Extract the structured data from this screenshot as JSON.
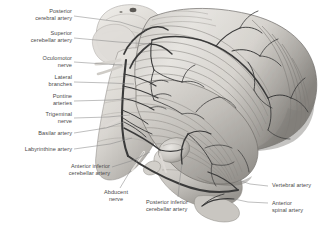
{
  "figure": {
    "type": "anatomical-illustration",
    "style": "grayscale halftone medical illustration",
    "background_color": "#ffffff",
    "label_color": "#4a4a4a",
    "leader_line_color": "#8a8a8a",
    "artery_color": "#3a3a3a",
    "tissue_light": "#e8e6e2",
    "tissue_mid": "#b9b6b1",
    "tissue_dark": "#7d7a76"
  },
  "labels": [
    {
      "id": "posterior-cerebral-artery",
      "text": "Posterior\ncerebral artery",
      "align": "right",
      "x": 8,
      "y": 8,
      "w": 64,
      "leader": [
        [
          74,
          16
        ],
        [
          120,
          22
        ],
        [
          146,
          30
        ]
      ]
    },
    {
      "id": "superior-cerebellar-artery",
      "text": "Superior\ncerebellar artery",
      "align": "right",
      "x": 4,
      "y": 30,
      "w": 68,
      "leader": [
        [
          74,
          38
        ],
        [
          118,
          42
        ],
        [
          150,
          44
        ]
      ]
    },
    {
      "id": "oculomotor-nerve",
      "text": "Oculomotor\nnerve",
      "align": "right",
      "x": 18,
      "y": 55,
      "w": 54,
      "leader": [
        [
          74,
          62
        ],
        [
          104,
          64
        ],
        [
          122,
          65
        ]
      ]
    },
    {
      "id": "lateral-branches",
      "text": "Lateral\nbranches",
      "align": "right",
      "x": 22,
      "y": 74,
      "w": 50,
      "leader": [
        [
          74,
          82
        ],
        [
          110,
          83
        ],
        [
          134,
          84
        ]
      ]
    },
    {
      "id": "pontine-arteries",
      "text": "Pontine\narteries",
      "align": "right",
      "x": 24,
      "y": 93,
      "w": 48,
      "leader": [
        [
          74,
          101
        ],
        [
          112,
          100
        ],
        [
          136,
          98
        ]
      ]
    },
    {
      "id": "trigeminal-nerve",
      "text": "Trigeminal\nnerve",
      "align": "right",
      "x": 20,
      "y": 111,
      "w": 52,
      "leader": [
        [
          74,
          118
        ],
        [
          108,
          117
        ],
        [
          130,
          115
        ]
      ]
    },
    {
      "id": "basilar-artery",
      "text": "Basilar artery",
      "align": "right",
      "x": 18,
      "y": 130,
      "w": 54,
      "leader": [
        [
          74,
          133
        ],
        [
          106,
          128
        ],
        [
          124,
          122
        ]
      ]
    },
    {
      "id": "labyrinthine-artery",
      "text": "Labyrinthine artery",
      "align": "right",
      "x": 8,
      "y": 146,
      "w": 64,
      "leader": [
        [
          74,
          149
        ],
        [
          110,
          144
        ],
        [
          132,
          138
        ]
      ]
    },
    {
      "id": "anterior-inferior-cerebellar-artery",
      "text": "Anterior inferior\ncerebellar artery",
      "align": "right",
      "x": 44,
      "y": 163,
      "w": 66,
      "leader": [
        [
          112,
          167
        ],
        [
          134,
          160
        ],
        [
          150,
          152
        ]
      ]
    },
    {
      "id": "abducent-nerve",
      "text": "Abducent\nnerve",
      "align": "center",
      "x": 94,
      "y": 189,
      "w": 44,
      "leader": [
        [
          120,
          188
        ],
        [
          132,
          168
        ],
        [
          144,
          152
        ]
      ]
    },
    {
      "id": "posterior-inferior-cerebellar-artery",
      "text": "Posterior inferior\ncerebellar artery",
      "align": "left",
      "x": 146,
      "y": 199,
      "w": 66,
      "leader": [
        [
          178,
          197
        ],
        [
          180,
          178
        ],
        [
          182,
          164
        ]
      ]
    },
    {
      "id": "vertebral-artery",
      "text": "Vertebral artery",
      "align": "left",
      "x": 272,
      "y": 182,
      "w": 62,
      "leader": [
        [
          268,
          186
        ],
        [
          250,
          184
        ],
        [
          238,
          180
        ]
      ]
    },
    {
      "id": "anterior-spinal-artery",
      "text": "Anterior\nspinal artery",
      "align": "left",
      "x": 272,
      "y": 200,
      "w": 62,
      "leader": [
        [
          268,
          203
        ],
        [
          248,
          202
        ],
        [
          234,
          199
        ]
      ]
    }
  ],
  "anatomy": {
    "structures": [
      "midbrain",
      "cerebral peduncle",
      "pons",
      "medulla oblongata",
      "cerebellum",
      "cerebellar folia",
      "flocculus",
      "spinal cord"
    ]
  }
}
